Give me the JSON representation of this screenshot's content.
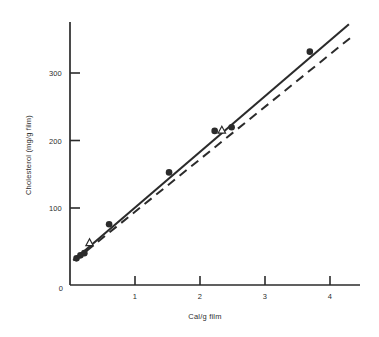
{
  "figure": {
    "background_color": "#ffffff",
    "ink_color": "#2b2b2b"
  },
  "chart_data": {
    "type": "scatter",
    "title": "",
    "subtitle": "",
    "xlabel": "Cal/g film",
    "ylabel": "Cholesterol (mg/g film)",
    "xlim": [
      0,
      4.45
    ],
    "ylim": [
      0,
      355
    ],
    "xticks": [
      0,
      1,
      2,
      3,
      4
    ],
    "xtick_labels": [
      "",
      "1",
      "2",
      "3",
      "4"
    ],
    "yticks": [
      0,
      100,
      200,
      300
    ],
    "ytick_labels": [
      "0",
      "100",
      "200",
      "300"
    ],
    "grid": false,
    "legend": "none",
    "legend_position": "none",
    "axis_style": "two-spine-left-bottom",
    "series": [
      {
        "name": "filled-circles",
        "marker": "filled-circle",
        "marker_color": "#2b2b2b",
        "points": [
          {
            "x": 0.1,
            "y": 36
          },
          {
            "x": 0.16,
            "y": 40
          },
          {
            "x": 0.22,
            "y": 43
          },
          {
            "x": 0.6,
            "y": 82
          },
          {
            "x": 1.52,
            "y": 152
          },
          {
            "x": 2.22,
            "y": 208
          },
          {
            "x": 2.48,
            "y": 213
          },
          {
            "x": 3.68,
            "y": 315
          }
        ]
      },
      {
        "name": "open-triangles",
        "marker": "open-triangle",
        "marker_color": "#2b2b2b",
        "points": [
          {
            "x": 0.3,
            "y": 57
          },
          {
            "x": 2.33,
            "y": 209
          }
        ]
      }
    ],
    "fit_lines": [
      {
        "name": "solid-regression-line",
        "style": "solid",
        "color": "#2b2b2b",
        "x_start": 0.05,
        "y_start": 33,
        "x_end": 4.28,
        "y_end": 352
      },
      {
        "name": "dashed-regression-line",
        "style": "dashed",
        "color": "#2b2b2b",
        "dash_pattern": "9 6",
        "x_start": 0.07,
        "y_start": 33,
        "x_end": 4.35,
        "y_end": 337
      }
    ]
  }
}
